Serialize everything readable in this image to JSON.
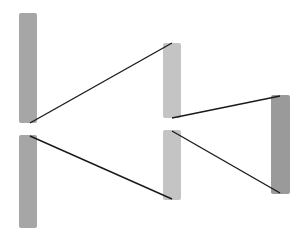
{
  "diagram": {
    "type": "node-link",
    "background": "#ffffff",
    "nodes": [
      {
        "id": "left-top",
        "x": 19,
        "y": 13,
        "w": 18,
        "h": 110,
        "color": "#a6a6a6"
      },
      {
        "id": "left-bottom",
        "x": 19,
        "y": 135,
        "w": 18,
        "h": 93,
        "color": "#a6a6a6"
      },
      {
        "id": "mid-top",
        "x": 163,
        "y": 43,
        "w": 18,
        "h": 75,
        "color": "#c4c4c4"
      },
      {
        "id": "mid-bottom",
        "x": 163,
        "y": 130,
        "w": 18,
        "h": 70,
        "color": "#c4c4c4"
      },
      {
        "id": "right",
        "x": 271,
        "y": 95,
        "w": 19,
        "h": 99,
        "color": "#9a9a9a"
      }
    ],
    "edges": [
      {
        "from": "left-top",
        "to": "mid-top",
        "x1": 30,
        "y1": 123,
        "x2": 172,
        "y2": 43
      },
      {
        "from": "left-bottom",
        "to": "mid-bottom",
        "x1": 30,
        "y1": 136,
        "x2": 172,
        "y2": 199
      },
      {
        "from": "mid-top",
        "to": "right",
        "x1": 172,
        "y1": 118,
        "x2": 280,
        "y2": 96
      },
      {
        "from": "mid-bottom",
        "to": "right",
        "x1": 172,
        "y1": 131,
        "x2": 280,
        "y2": 193
      }
    ],
    "edge_color": "#1a1a1a"
  }
}
